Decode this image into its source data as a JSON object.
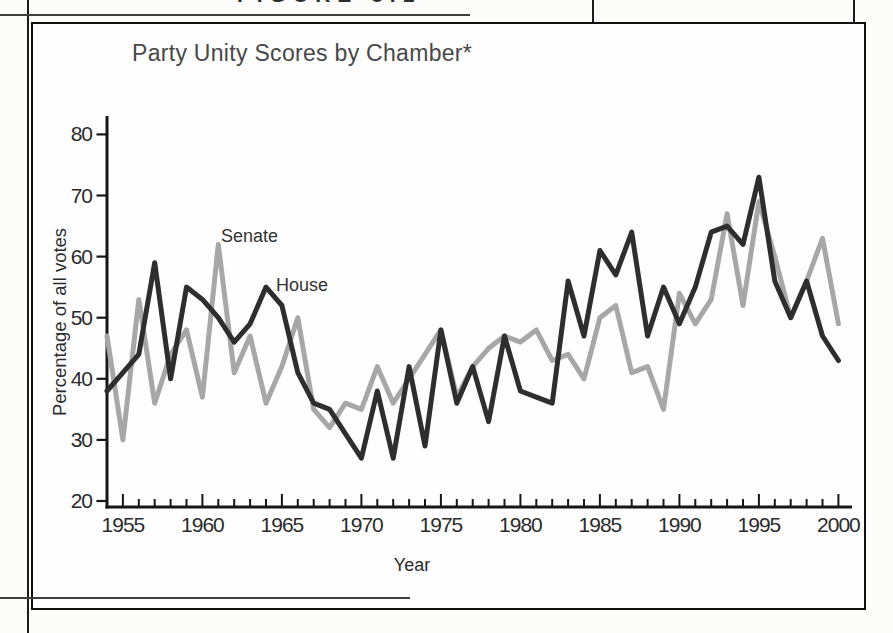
{
  "page": {
    "figure_label": "FIGURE 8.1"
  },
  "card": {
    "title": "Party Unity Scores by Chamber*"
  },
  "chart_data": {
    "type": "line",
    "title": "Party Unity Scores by Chamber*",
    "xlabel": "Year",
    "ylabel": "Percentage of all votes",
    "xlim": [
      1954,
      2000
    ],
    "ylim": [
      20,
      80
    ],
    "grid": false,
    "legend_position": "inline-annotations",
    "y_ticks": [
      20,
      30,
      40,
      50,
      60,
      70,
      80
    ],
    "x_major_ticks": [
      1955,
      1960,
      1965,
      1970,
      1975,
      1980,
      1985,
      1990,
      1995,
      2000
    ],
    "x_minor_tick_interval_years": 1,
    "x": [
      1954,
      1955,
      1956,
      1957,
      1958,
      1959,
      1960,
      1961,
      1962,
      1963,
      1964,
      1965,
      1966,
      1967,
      1968,
      1969,
      1970,
      1971,
      1972,
      1973,
      1974,
      1975,
      1976,
      1977,
      1978,
      1979,
      1980,
      1981,
      1982,
      1983,
      1984,
      1985,
      1986,
      1987,
      1988,
      1989,
      1990,
      1991,
      1992,
      1993,
      1994,
      1995,
      1996,
      1997,
      1998,
      1999,
      2000
    ],
    "series": [
      {
        "name": "Senate",
        "color": "#a7a7a7",
        "values": [
          47,
          30,
          53,
          36,
          44,
          48,
          37,
          62,
          41,
          47,
          36,
          42,
          50,
          35,
          32,
          36,
          35,
          42,
          36,
          40,
          44,
          48,
          37,
          42,
          45,
          47,
          46,
          48,
          43,
          44,
          40,
          50,
          52,
          41,
          42,
          35,
          54,
          49,
          53,
          67,
          52,
          69,
          60,
          50,
          56,
          63,
          49
        ]
      },
      {
        "name": "House",
        "color": "#2e2e2e",
        "values": [
          38,
          41,
          44,
          59,
          40,
          55,
          53,
          50,
          46,
          49,
          55,
          52,
          41,
          36,
          35,
          31,
          27,
          38,
          27,
          42,
          29,
          48,
          36,
          42,
          33,
          47,
          38,
          37,
          36,
          56,
          47,
          61,
          57,
          64,
          47,
          55,
          49,
          55,
          64,
          65,
          62,
          73,
          56,
          50,
          56,
          47,
          43
        ]
      }
    ],
    "annotations": [
      {
        "text": "Senate",
        "x_px": 221,
        "y_px": 242,
        "points_to": {
          "series": "Senate",
          "year": 1961,
          "value": 62
        }
      },
      {
        "text": "House",
        "x_px": 276,
        "y_px": 291,
        "points_to": {
          "series": "House",
          "year": 1964,
          "value": 55
        }
      }
    ],
    "axis_color": "#161616",
    "tick_label_color": "#2b2b2b"
  }
}
